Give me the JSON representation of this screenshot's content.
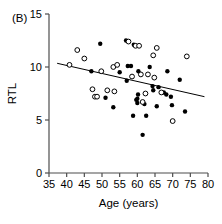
{
  "chart_data": {
    "type": "scatter",
    "title": "",
    "panel_label": "(B)",
    "xlabel": "Age (years)",
    "ylabel": "RTL",
    "xlim": [
      35,
      80
    ],
    "ylim": [
      0,
      15
    ],
    "xticks": [
      35,
      40,
      45,
      50,
      55,
      60,
      65,
      70,
      75,
      80
    ],
    "yticks": [
      0,
      5,
      10,
      15
    ],
    "grid": false,
    "legend": "none",
    "marker_colors": {
      "filled": "#000000",
      "open": "#ffffff",
      "open_stroke": "#000000",
      "line": "#000000"
    },
    "series": [
      {
        "name": "filled-circles",
        "marker": "filled-circle",
        "points": [
          [
            47.0,
            9.6
          ],
          [
            49.5,
            12.2
          ],
          [
            51.0,
            7.1
          ],
          [
            53.2,
            6.2
          ],
          [
            55.0,
            9.5
          ],
          [
            56.8,
            12.5
          ],
          [
            57.0,
            8.7
          ],
          [
            57.3,
            10.1
          ],
          [
            58.2,
            10.1
          ],
          [
            58.8,
            5.4
          ],
          [
            59.0,
            12.1
          ],
          [
            59.7,
            6.9
          ],
          [
            60.0,
            7.0
          ],
          [
            60.0,
            6.6
          ],
          [
            60.2,
            7.4
          ],
          [
            60.3,
            9.6
          ],
          [
            61.5,
            3.6
          ],
          [
            62.0,
            6.5
          ],
          [
            62.5,
            5.4
          ],
          [
            63.5,
            10.0
          ],
          [
            64.3,
            8.2
          ],
          [
            64.5,
            7.8
          ],
          [
            65.5,
            6.3
          ],
          [
            66.0,
            8.1
          ],
          [
            67.5,
            7.6
          ],
          [
            68.2,
            7.4
          ],
          [
            68.5,
            9.6
          ],
          [
            69.5,
            7.2
          ],
          [
            69.8,
            6.4
          ],
          [
            72.0,
            8.8
          ],
          [
            73.5,
            5.8
          ]
        ]
      },
      {
        "name": "open-circles",
        "marker": "open-circle",
        "points": [
          [
            40.8,
            10.2
          ],
          [
            43.0,
            11.6
          ],
          [
            45.0,
            10.8
          ],
          [
            47.3,
            7.9
          ],
          [
            48.0,
            7.2
          ],
          [
            48.6,
            7.2
          ],
          [
            49.8,
            9.6
          ],
          [
            51.5,
            7.8
          ],
          [
            53.2,
            10.0
          ],
          [
            53.5,
            7.7
          ],
          [
            54.3,
            10.2
          ],
          [
            57.5,
            12.4
          ],
          [
            58.5,
            9.1
          ],
          [
            59.5,
            12.0
          ],
          [
            60.5,
            12.0
          ],
          [
            61.0,
            9.3
          ],
          [
            61.5,
            6.7
          ],
          [
            62.3,
            7.5
          ],
          [
            63.0,
            9.3
          ],
          [
            64.5,
            11.1
          ],
          [
            64.8,
            9.0
          ],
          [
            65.5,
            11.8
          ],
          [
            66.8,
            7.6
          ],
          [
            70.0,
            4.9
          ],
          [
            74.0,
            11.0
          ]
        ]
      }
    ],
    "trendline": {
      "name": "regression-line",
      "x_start": 37.3,
      "y_start": 10.35,
      "x_end": 79.0,
      "y_end": 7.2
    }
  }
}
